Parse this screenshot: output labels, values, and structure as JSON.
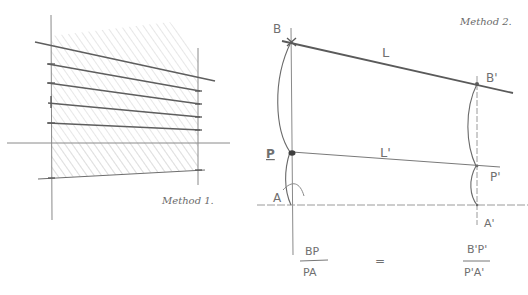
{
  "figure": {
    "type": "hand-drawn perspective construction sketch",
    "colors": {
      "ink": "#5e5e5e",
      "ink_light": "#9a9a9a",
      "hatch": "#cfcfcf",
      "background": "#ffffff"
    }
  },
  "method1": {
    "label": "Method 1.",
    "description": "Trapezoid between two verticals divided by converging horizontal lines, shaded with diagonal hatching"
  },
  "method2": {
    "label": "Method 2.",
    "points": {
      "B": "B",
      "B_prime": "B'",
      "P": "P",
      "P_prime": "P'",
      "A": "A",
      "A_prime": "A'"
    },
    "lines": {
      "L": "L",
      "L_prime": "L'"
    },
    "equation": {
      "left_numerator": "BP",
      "left_denominator": "PA",
      "equals": "=",
      "right_numerator": "B'P'",
      "right_denominator": "P'A'"
    }
  }
}
